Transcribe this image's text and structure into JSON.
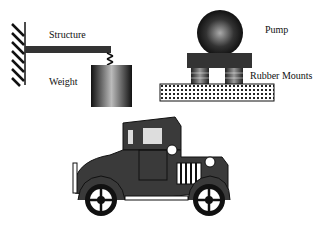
{
  "diagram": {
    "labels": {
      "structure": "Structure",
      "weight": "Weight",
      "pump": "Pump",
      "rubber_mounts": "Rubber Mounts"
    },
    "panels": [
      {
        "name": "cantilever-weight",
        "components": [
          "wall",
          "structure beam",
          "spring",
          "weight"
        ]
      },
      {
        "name": "pump-on-mounts",
        "components": [
          "pump sphere",
          "base plate",
          "rubber mounts",
          "foundation"
        ]
      },
      {
        "name": "vintage-car",
        "components": [
          "car body",
          "wheels",
          "headlamps",
          "grille"
        ]
      }
    ],
    "colors": {
      "dark": "#1a1a1a",
      "body": "#3a3a3a",
      "background": "#ffffff"
    }
  }
}
